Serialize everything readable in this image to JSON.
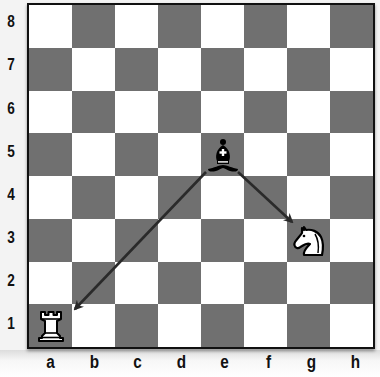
{
  "diagram": {
    "colors": {
      "dark_square": "#707070",
      "light_square": "#ffffff",
      "border": "#111111",
      "arrow": "#2a2a2a"
    },
    "ranks": [
      "8",
      "7",
      "6",
      "5",
      "4",
      "3",
      "2",
      "1"
    ],
    "files": [
      "a",
      "b",
      "c",
      "d",
      "e",
      "f",
      "g",
      "h"
    ],
    "pieces": [
      {
        "square": "e5",
        "piece": "bishop",
        "color": "black",
        "icon": "black-bishop-icon",
        "glyph": "♝"
      },
      {
        "square": "g3",
        "piece": "knight",
        "color": "white",
        "icon": "white-knight-icon",
        "glyph": "♘"
      },
      {
        "square": "a1",
        "piece": "rook",
        "color": "white",
        "icon": "white-rook-icon",
        "glyph": "♖"
      }
    ],
    "arrows": [
      {
        "from": "e5",
        "to": "a1",
        "label": "bishop-attacks-rook"
      },
      {
        "from": "e5",
        "to": "g3",
        "label": "bishop-attacks-knight"
      }
    ]
  }
}
